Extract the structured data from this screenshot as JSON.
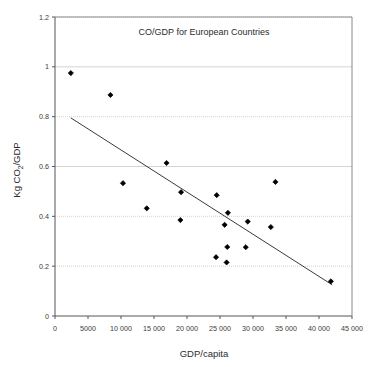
{
  "chart_data": {
    "type": "scatter",
    "title": "CO/GDP for European Countries",
    "xlabel": "GDP/capita",
    "ylabel_parts": {
      "pre": "Kg CO",
      "sub": "2",
      "post": "/GDP"
    },
    "ylabel": "Kg CO2/GDP",
    "xlim": [
      0,
      45000
    ],
    "ylim": [
      0,
      1.2
    ],
    "grid": true,
    "grid_axis": "y",
    "legend": null,
    "xticks": [
      0,
      5000,
      10000,
      15000,
      20000,
      25000,
      30000,
      35000,
      40000,
      45000
    ],
    "xtick_labels": [
      "0",
      "5000",
      "10 000",
      "15 000",
      "20 000",
      "25 000",
      "30 000",
      "35 000",
      "40 000",
      "45 000"
    ],
    "yticks": [
      0,
      0.2,
      0.4,
      0.6,
      0.8,
      1,
      1.2
    ],
    "ytick_labels": [
      "0",
      "0.2",
      "0.4",
      "0.6",
      "0.8",
      "1",
      "1.2"
    ],
    "marker": "diamond",
    "marker_color": "#000000",
    "points": [
      {
        "x": 2400,
        "y": 0.975
      },
      {
        "x": 8400,
        "y": 0.887
      },
      {
        "x": 16900,
        "y": 0.614
      },
      {
        "x": 10300,
        "y": 0.533
      },
      {
        "x": 33400,
        "y": 0.538
      },
      {
        "x": 19100,
        "y": 0.497
      },
      {
        "x": 24500,
        "y": 0.485
      },
      {
        "x": 13900,
        "y": 0.432
      },
      {
        "x": 26200,
        "y": 0.414
      },
      {
        "x": 19000,
        "y": 0.385
      },
      {
        "x": 29200,
        "y": 0.379
      },
      {
        "x": 25700,
        "y": 0.366
      },
      {
        "x": 32700,
        "y": 0.357
      },
      {
        "x": 26100,
        "y": 0.277
      },
      {
        "x": 28900,
        "y": 0.276
      },
      {
        "x": 24400,
        "y": 0.236
      },
      {
        "x": 26000,
        "y": 0.215
      },
      {
        "x": 41800,
        "y": 0.139
      }
    ],
    "trendline": {
      "type": "linear",
      "x0": 2400,
      "y0": 0.795,
      "x1": 42000,
      "y1": 0.125,
      "color": "#3a3a3a"
    }
  },
  "chart": {
    "title": "CO/GDP for European Countries",
    "x_axis_title": "GDP/capita",
    "y_axis_title_pre": "Kg CO",
    "y_axis_title_sub": "2",
    "y_axis_title_post": "/GDP"
  }
}
